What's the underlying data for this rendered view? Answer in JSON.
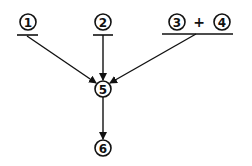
{
  "diagram": {
    "nodes": [
      {
        "id": "n1",
        "label": "1",
        "cx": 28,
        "cy": 22
      },
      {
        "id": "n2",
        "label": "2",
        "cx": 103,
        "cy": 22
      },
      {
        "id": "n3",
        "label": "3",
        "cx": 177,
        "cy": 22
      },
      {
        "id": "n4",
        "label": "4",
        "cx": 222,
        "cy": 22
      },
      {
        "id": "n5",
        "label": "5",
        "cx": 103,
        "cy": 89
      },
      {
        "id": "n6",
        "label": "6",
        "cx": 103,
        "cy": 148
      }
    ],
    "operator": "+",
    "edges": [
      {
        "from": "1",
        "to": "5"
      },
      {
        "from": "2",
        "to": "5"
      },
      {
        "from": "3+4",
        "to": "5"
      },
      {
        "from": "5",
        "to": "6"
      }
    ],
    "stroke_color": "#111111"
  }
}
